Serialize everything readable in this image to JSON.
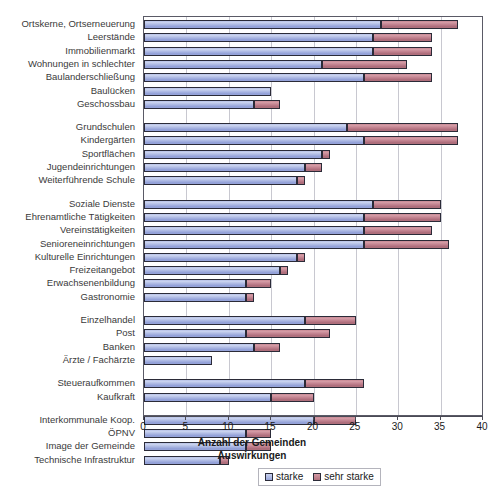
{
  "chart_data": {
    "type": "bar",
    "orientation": "horizontal",
    "stacked": true,
    "title": "",
    "xlabel_lines": [
      "Anzahl der Gemeinden",
      "Auswirkungen"
    ],
    "ylabel": "",
    "xlim": [
      0,
      40
    ],
    "xticks": [
      0,
      5,
      10,
      15,
      20,
      25,
      30,
      35,
      40
    ],
    "grid": "vertical",
    "legend_position": "bottom-center",
    "legend": [
      "starke",
      "sehr starke"
    ],
    "colors": {
      "starke": "#aab6e2",
      "sehr_starke": "#c07f8d",
      "bar_border": "#2b2b38",
      "gridline": "#c8c8d0",
      "frame": "#5a5a66"
    },
    "groups": [
      {
        "name": "Siedlung",
        "categories": [
          "Ortskerne, Ortserneuerung",
          "Leerstände",
          "Immobilienmarkt",
          "Wohnungen in schlechter",
          "Baulanderschließung",
          "Baulücken",
          "Geschossbau"
        ],
        "starke": [
          28,
          27,
          27,
          21,
          26,
          15,
          13
        ],
        "sehr_starke": [
          37,
          34,
          34,
          31,
          34,
          0,
          16
        ]
      },
      {
        "name": "Bildung",
        "categories": [
          "Grundschulen",
          "Kindergärten",
          "Sportflächen",
          "Jugendeinrichtungen",
          "Weiterführende Schule"
        ],
        "starke": [
          24,
          26,
          21,
          19,
          18
        ],
        "sehr_starke": [
          37,
          37,
          22,
          21,
          19
        ]
      },
      {
        "name": "Soziales",
        "categories": [
          "Soziale Dienste",
          "Ehrenamtliche Tätigkeiten",
          "Vereinstätigkeiten",
          "Senioreneinrichtungen",
          "Kulturelle Einrichtungen",
          "Freizeitangebot",
          "Erwachsenenbildung",
          "Gastronomie"
        ],
        "starke": [
          27,
          26,
          26,
          26,
          18,
          16,
          12,
          12
        ],
        "sehr_starke": [
          35,
          35,
          34,
          36,
          19,
          17,
          15,
          13
        ]
      },
      {
        "name": "Versorgung",
        "categories": [
          "Einzelhandel",
          "Post",
          "Banken",
          "Ärzte / Fachärzte"
        ],
        "starke": [
          19,
          12,
          13,
          8
        ],
        "sehr_starke": [
          25,
          22,
          16,
          0
        ]
      },
      {
        "name": "Wirtschaft",
        "categories": [
          "Steueraufkommen",
          "Kaufkraft"
        ],
        "starke": [
          19,
          15
        ],
        "sehr_starke": [
          26,
          20
        ]
      },
      {
        "name": "Sonstiges",
        "categories": [
          "Interkommunale Koop.",
          "ÖPNV",
          "Image der Gemeinde",
          "Technische Infrastruktur"
        ],
        "starke": [
          20,
          12,
          12,
          9
        ],
        "sehr_starke": [
          25,
          15,
          15,
          10
        ]
      }
    ]
  },
  "axis": {
    "tick_labels": [
      "0",
      "5",
      "10",
      "15",
      "20",
      "25",
      "30",
      "35",
      "40"
    ],
    "title_line1": "Anzahl der Gemeinden",
    "title_line2": "Auswirkungen"
  },
  "legend": {
    "items": [
      {
        "label": "starke",
        "color": "#aab6e2"
      },
      {
        "label": "sehr starke",
        "color": "#c07f8d"
      }
    ]
  }
}
